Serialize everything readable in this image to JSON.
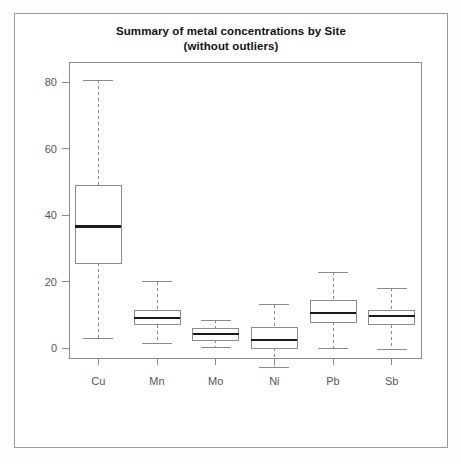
{
  "chart_data": {
    "type": "box",
    "title": "Summary of metal concentrations by Site",
    "subtitle": "(without outliers)",
    "xlabel": "",
    "ylabel": "",
    "ylim": [
      -10,
      86
    ],
    "grid": false,
    "legend": null,
    "categories": [
      "Cu",
      "Mn",
      "Mo",
      "Ni",
      "Pb",
      "Sb"
    ],
    "y_ticks": [
      0,
      20,
      40,
      60,
      80
    ],
    "y_tick_labels": [
      "0",
      "20",
      "40",
      "60",
      "80"
    ],
    "boxes": [
      {
        "category": "Cu",
        "whisker_low": 3.0,
        "q1": 25.5,
        "median": 36.5,
        "q3": 49.0,
        "whisker_high": 80.5
      },
      {
        "category": "Mn",
        "whisker_low": 1.5,
        "q1": 7.0,
        "median": 9.0,
        "q3": 11.4,
        "whisker_high": 20.0
      },
      {
        "category": "Mo",
        "whisker_low": 0.3,
        "q1": 2.4,
        "median": 4.2,
        "q3": 6.0,
        "whisker_high": 8.4
      },
      {
        "category": "Ni",
        "whisker_low": -6.0,
        "q1": 0.0,
        "median": 2.4,
        "q3": 6.3,
        "whisker_high": 13.0
      },
      {
        "category": "Pb",
        "whisker_low": 0.0,
        "q1": 7.8,
        "median": 10.5,
        "q3": 14.4,
        "whisker_high": 22.8
      },
      {
        "category": "Sb",
        "whisker_low": -0.5,
        "q1": 7.0,
        "median": 9.6,
        "q3": 11.4,
        "whisker_high": 18.0
      }
    ],
    "colors": {
      "box_stroke": "#8a8a8a",
      "box_fill": "#ffffff",
      "median_stroke": "#1a1a1a",
      "whisker_stroke": "#8a8a8a",
      "axis_stroke": "#8a8a8a",
      "tick_label": "#555555",
      "title": "#111111",
      "figure_background": "#ffffff",
      "frame_stroke": "#9a9a9a"
    }
  }
}
